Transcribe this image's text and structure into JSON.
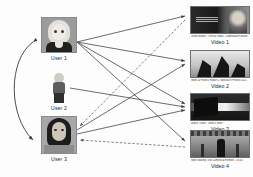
{
  "figure": {
    "background_color": "#fdfdfd",
    "edge_color": "#3a3a3a"
  },
  "users": [
    {
      "id": "user-1",
      "label": "User 1",
      "avatar_icon": "female-cartoon-avatar-icon",
      "x": 41,
      "y": 17
    },
    {
      "id": "user-2",
      "label": "User 2",
      "avatar_icon": "standing-figure-avatar-icon",
      "x": 50,
      "y": 73
    },
    {
      "id": "user-3",
      "label": "User 3",
      "avatar_icon": "female-photo-avatar-icon",
      "x": 41,
      "y": 116
    }
  ],
  "videos": [
    {
      "id": "video-1",
      "label": "Video 1",
      "caption": "Justin Bieber - Official Video - Download Preview",
      "thumbnail_icon": "interview-scene-thumbnail-icon",
      "x": 189,
      "y": 6
    },
    {
      "id": "video-2",
      "label": "Video 2",
      "caption": "News & Politics Report 2 Special in Protest 2021",
      "thumbnail_icon": "crowd-flags-thumbnail-icon",
      "x": 189,
      "y": 50
    },
    {
      "id": "video-3",
      "label": "Video 3",
      "caption": "Movie Trailer - What's New?",
      "thumbnail_icon": "dark-screen-thumbnail-icon",
      "x": 189,
      "y": 93
    },
    {
      "id": "video-4",
      "label": "Video 4",
      "caption": "New Walking Tour Camera & Remote - 16:44",
      "thumbnail_icon": "street-scene-thumbnail-icon",
      "x": 189,
      "y": 130
    }
  ],
  "edges": {
    "solid_label": "user watches video",
    "dashed_label": "video recommended to user",
    "curved_label": "similar users"
  }
}
